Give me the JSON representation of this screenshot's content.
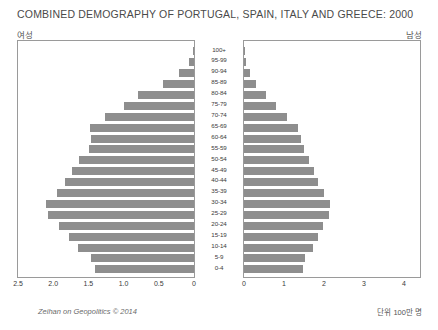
{
  "title": "COMBINED DEMOGRAPHY OF PORTUGAL, SPAIN, ITALY AND GREECE: 2000",
  "labels": {
    "female": "여성",
    "male": "남성",
    "credit": "Zeihan on Geopolitics © 2014",
    "unit": "단위 100만 명"
  },
  "chart_data": {
    "type": "bar",
    "title": "COMBINED DEMOGRAPHY OF PORTUGAL, SPAIN, ITALY AND GREECE: 2000",
    "orientation": "population-pyramid",
    "xlabel": "",
    "ylabel": "",
    "grid": false,
    "legend_position": "top",
    "categories": [
      "100+",
      "95-99",
      "90-94",
      "85-89",
      "80-84",
      "75-79",
      "70-74",
      "65-69",
      "60-64",
      "55-59",
      "50-54",
      "45-49",
      "40-44",
      "35-39",
      "30-34",
      "25-29",
      "20-24",
      "15-19",
      "10-14",
      "5-9",
      "0-4"
    ],
    "left_axis": {
      "name": "여성",
      "ticks": [
        "2.5",
        "2.0",
        "1.5",
        "1.0",
        "0.5",
        "0"
      ],
      "tick_values": [
        2.5,
        2.0,
        1.5,
        1.0,
        0.5,
        0
      ],
      "xlim": [
        2.5,
        0
      ],
      "direction": "reversed"
    },
    "right_axis": {
      "name": "남성",
      "ticks": [
        "0",
        "1",
        "2",
        "3",
        "4"
      ],
      "tick_values": [
        0,
        1,
        2,
        3,
        4
      ],
      "xlim": [
        0,
        4.4
      ]
    },
    "series": [
      {
        "name": "여성",
        "side": "left",
        "values": [
          0.01,
          0.07,
          0.22,
          0.44,
          0.79,
          1.0,
          1.27,
          1.48,
          1.46,
          1.49,
          1.63,
          1.73,
          1.83,
          1.95,
          2.1,
          2.07,
          1.92,
          1.78,
          1.65,
          1.46,
          1.4
        ]
      },
      {
        "name": "남성",
        "side": "right",
        "values": [
          0.01,
          0.05,
          0.14,
          0.3,
          0.56,
          0.8,
          1.08,
          1.34,
          1.42,
          1.5,
          1.63,
          1.74,
          1.86,
          1.99,
          2.15,
          2.12,
          1.98,
          1.85,
          1.73,
          1.53,
          1.47
        ]
      }
    ],
    "bar_color": "#8e8e8e"
  }
}
